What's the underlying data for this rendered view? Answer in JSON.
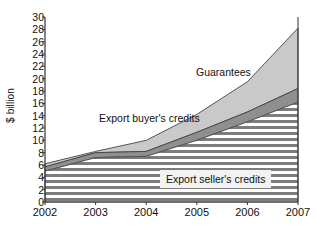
{
  "chart_data": {
    "type": "area",
    "stacked": true,
    "title": "",
    "xlabel": "",
    "ylabel": "$ billion",
    "x": [
      "2002",
      "2003",
      "2004",
      "2005",
      "2006",
      "2007"
    ],
    "xlim": [
      2002,
      2007
    ],
    "ylim": [
      0,
      30
    ],
    "ytick_step": 2,
    "yticks": [
      0,
      2,
      4,
      6,
      8,
      10,
      12,
      14,
      16,
      18,
      20,
      22,
      24,
      26,
      28,
      30
    ],
    "ytick_labels": [
      "0",
      "2",
      "4",
      "6",
      "8",
      "10",
      "12",
      "14",
      "16",
      "18",
      "20",
      "22",
      "24",
      "26",
      "28",
      "30"
    ],
    "xtick_labels": [
      "2002",
      "2003",
      "2004",
      "2005",
      "2006",
      "2007"
    ],
    "grid": false,
    "legend_position": "inline-annotations",
    "series": [
      {
        "name": "Export seller's credits",
        "values": [
          5.0,
          7.2,
          7.4,
          10.0,
          13.0,
          16.2
        ],
        "fill": "horizontal-hatch",
        "color": "#808080"
      },
      {
        "name": "Export buyer's credits",
        "values": [
          0.7,
          0.8,
          0.8,
          1.3,
          1.6,
          2.2
        ],
        "cumulative_top": [
          5.7,
          8.0,
          8.2,
          11.3,
          14.6,
          18.4
        ],
        "fill": "solid",
        "color": "#8f8f8f"
      },
      {
        "name": "Guarantees",
        "values": [
          0.5,
          0.2,
          1.8,
          2.9,
          4.9,
          9.8
        ],
        "cumulative_top": [
          6.2,
          8.2,
          10.0,
          14.2,
          19.5,
          28.2
        ],
        "fill": "solid",
        "color": "#c9c9c9"
      }
    ],
    "annotations": [
      {
        "text": "Guarantees",
        "series": "Guarantees"
      },
      {
        "text": "Export buyer's credits",
        "series": "Export buyer's credits"
      },
      {
        "text": "Export seller's credits",
        "series": "Export seller's credits"
      }
    ]
  },
  "axes": {
    "y_axis_label": "$ billion",
    "y_tick_labels": [
      "30",
      "28",
      "26",
      "24",
      "22",
      "20",
      "18",
      "16",
      "14",
      "12",
      "10",
      "8",
      "6",
      "4",
      "2",
      "0"
    ],
    "x_tick_labels": [
      "2002",
      "2003",
      "2004",
      "2005",
      "2006",
      "2007"
    ]
  },
  "annotations": {
    "guarantees": "Guarantees",
    "buyers_credits": "Export buyer's credits",
    "sellers_credits": "Export seller's credits"
  },
  "colors": {
    "guarantees_fill": "#c9c9c9",
    "buyers_fill": "#8f8f8f",
    "sellers_hatch": "#808080",
    "axis": "#333333",
    "text": "#111111",
    "background": "#ffffff"
  }
}
